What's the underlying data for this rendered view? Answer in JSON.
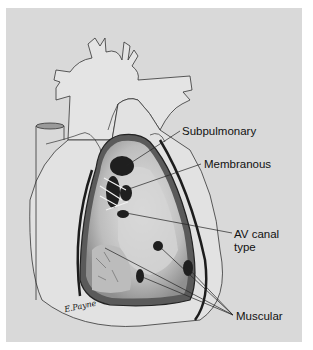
{
  "figure": {
    "background_color": "#d9d9d9",
    "labels": [
      {
        "id": "subpulmonary",
        "text": "Subpulmonary"
      },
      {
        "id": "membranous",
        "text": "Membranous"
      },
      {
        "id": "av_canal_line1",
        "text": "AV canal"
      },
      {
        "id": "av_canal_line2",
        "text": "type"
      },
      {
        "id": "muscular",
        "text": "Muscular"
      }
    ],
    "signature": "E.Payne"
  }
}
